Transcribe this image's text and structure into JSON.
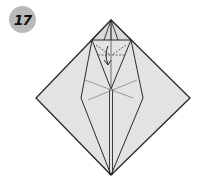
{
  "diagram": {
    "type": "origami-step",
    "step_number": "17",
    "colors": {
      "paper": "#e3e3e3",
      "line": "#2a2a2a",
      "badge": "#b9b9b9",
      "background": "#ffffff"
    },
    "shape": {
      "outline": "diamond",
      "points": {
        "top": [
          111,
          20
        ],
        "left": [
          36,
          98
        ],
        "right": [
          190,
          98
        ],
        "bottom": [
          111,
          175
        ]
      }
    },
    "annotations": {
      "fold_arrow": "arrow pointing down at top flap",
      "dashed_fold_line": "valley fold across top triangle"
    }
  }
}
